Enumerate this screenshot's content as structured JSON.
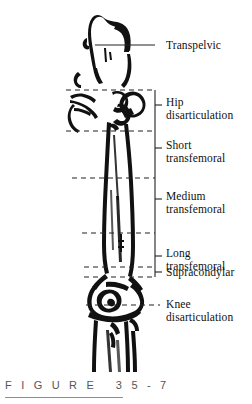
{
  "figure": {
    "caption": "F I G U R E   3 5 - 7",
    "colors": {
      "ink": "#111111",
      "background": "#ffffff",
      "caption_text": "#555555",
      "rule": "#8d8d8d",
      "guide_line": "#222222"
    }
  },
  "labels": [
    {
      "id": "transpelvic",
      "lines": [
        "Transpelvic"
      ],
      "x": 166,
      "y": 39
    },
    {
      "id": "hip-disartic",
      "lines": [
        "Hip",
        "disarticulation"
      ],
      "x": 166,
      "y": 96
    },
    {
      "id": "short-transfem",
      "lines": [
        "Short",
        "transfemoral"
      ],
      "x": 166,
      "y": 139
    },
    {
      "id": "medium-transfem",
      "lines": [
        "Medium",
        "transfemoral"
      ],
      "x": 166,
      "y": 190
    },
    {
      "id": "long-transfem",
      "lines": [
        "Long",
        "transfemoral"
      ],
      "x": 166,
      "y": 247
    },
    {
      "id": "supracondylar",
      "lines": [
        "Supracondylar"
      ],
      "x": 166,
      "y": 266
    },
    {
      "id": "knee-disartic",
      "lines": [
        "Knee",
        "disarticulation"
      ],
      "x": 166,
      "y": 298
    }
  ],
  "level_lines": [
    {
      "id": "transpelvic-line",
      "style": "solid",
      "x1": 95,
      "x2": 155,
      "y": 45
    },
    {
      "id": "hip-upper-line",
      "style": "dashed",
      "x1": 66,
      "x2": 155,
      "y": 90
    },
    {
      "id": "hip-lower-line",
      "style": "dashed",
      "x1": 66,
      "x2": 155,
      "y": 131
    },
    {
      "id": "short-lower-line",
      "style": "dashed",
      "x1": 72,
      "x2": 155,
      "y": 178
    },
    {
      "id": "medium-lower-line",
      "style": "dashed",
      "x1": 82,
      "x2": 155,
      "y": 233
    },
    {
      "id": "long-lower-line",
      "style": "dashed",
      "x1": 84,
      "x2": 155,
      "y": 267
    },
    {
      "id": "supracond-line",
      "style": "dashed",
      "x1": 84,
      "x2": 155,
      "y": 277
    },
    {
      "id": "knee-line",
      "style": "dashed",
      "x1": 86,
      "x2": 160,
      "y": 305
    }
  ],
  "bracket": {
    "id": "level-bracket",
    "x": 155,
    "y_top": 90,
    "y_bottom": 277,
    "tick_length": 7,
    "ticks": [
      105,
      148,
      199,
      256,
      272
    ]
  }
}
